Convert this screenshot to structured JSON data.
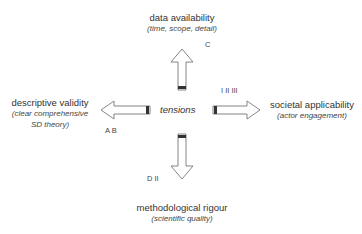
{
  "center_label": "tensions",
  "top": {
    "title": "data availability",
    "subtitle": "(time, scope, detail)",
    "codes": "C"
  },
  "left": {
    "title": "descriptive validity",
    "subtitle_line1": "(clear comprehensive",
    "subtitle_line2": "SD theory)",
    "codes": "A B"
  },
  "right": {
    "title": "societal applicability",
    "subtitle": "(actor engagement)",
    "codes": "I II III"
  },
  "bottom": {
    "title": "methodological rigour",
    "subtitle": "(scientific quality)",
    "codes": "D II"
  },
  "colors": {
    "arrow_outline": "#777777",
    "arrow_tail": "#333333",
    "text": "#333333"
  }
}
